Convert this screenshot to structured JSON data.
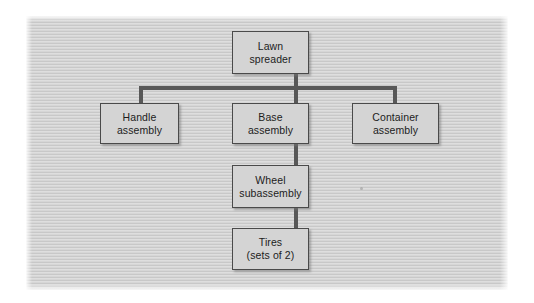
{
  "diagram": {
    "type": "product-structure-tree",
    "colors": {
      "panel_background": "#d0d0d0",
      "node_fill": "#d4d4d4",
      "node_border": "#4a4a4a",
      "connector": "#585858",
      "text": "#1c1c1c",
      "page_background": "#ffffff"
    },
    "nodes": [
      {
        "id": "lawn-spreader",
        "level": 0,
        "line1": "Lawn",
        "line2": "spreader",
        "full_label": "Lawn spreader"
      },
      {
        "id": "handle-assembly",
        "level": 1,
        "line1": "Handle",
        "line2": "assembly",
        "full_label": "Handle assembly"
      },
      {
        "id": "base-assembly",
        "level": 1,
        "line1": "Base",
        "line2": "assembly",
        "full_label": "Base assembly"
      },
      {
        "id": "container-assembly",
        "level": 1,
        "line1": "Container",
        "line2": "assembly",
        "full_label": "Container assembly"
      },
      {
        "id": "wheel-subassembly",
        "level": 2,
        "line1": "Wheel",
        "line2": "subassembly",
        "full_label": "Wheel subassembly"
      },
      {
        "id": "tires",
        "level": 3,
        "line1": "Tires",
        "line2": "(sets of 2)",
        "full_label": "Tires (sets of 2)"
      }
    ],
    "edges": [
      {
        "from": "lawn-spreader",
        "to": "handle-assembly"
      },
      {
        "from": "lawn-spreader",
        "to": "base-assembly"
      },
      {
        "from": "lawn-spreader",
        "to": "container-assembly"
      },
      {
        "from": "base-assembly",
        "to": "wheel-subassembly"
      },
      {
        "from": "wheel-subassembly",
        "to": "tires"
      }
    ]
  }
}
